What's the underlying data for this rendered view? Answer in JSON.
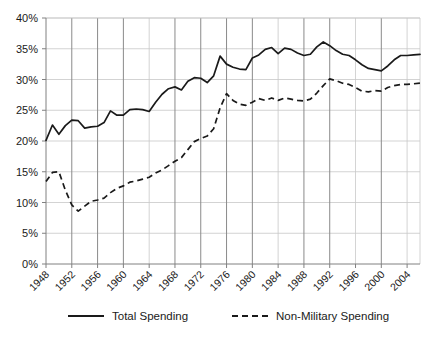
{
  "chart_data": {
    "type": "line",
    "title": "",
    "subtitle": "",
    "xlabel": "",
    "ylabel": "",
    "xlim": [
      1948,
      2006
    ],
    "ylim": [
      0,
      40
    ],
    "yticks": [
      "0%",
      "5%",
      "10%",
      "15%",
      "20%",
      "25%",
      "30%",
      "35%",
      "40%"
    ],
    "ytick_values": [
      0,
      5,
      10,
      15,
      20,
      25,
      30,
      35,
      40
    ],
    "xticks": [
      "1948",
      "1952",
      "1956",
      "1960",
      "1964",
      "1968",
      "1972",
      "1976",
      "1980",
      "1984",
      "1988",
      "1992",
      "1996",
      "2000",
      "2004"
    ],
    "xtick_values": [
      1948,
      1952,
      1956,
      1960,
      1964,
      1968,
      1972,
      1976,
      1980,
      1984,
      1988,
      1992,
      1996,
      2000,
      2004
    ],
    "grid": "horizontal-minor-and-vertical",
    "major_gridline_years": [
      1952,
      1956,
      1960,
      1968,
      1972,
      1976,
      1980,
      1988,
      1992,
      2000
    ],
    "legend_position": "bottom",
    "x": [
      1948,
      1949,
      1950,
      1951,
      1952,
      1953,
      1954,
      1955,
      1956,
      1957,
      1958,
      1959,
      1960,
      1961,
      1962,
      1963,
      1964,
      1965,
      1966,
      1967,
      1968,
      1969,
      1970,
      1971,
      1972,
      1973,
      1974,
      1975,
      1976,
      1977,
      1978,
      1979,
      1980,
      1981,
      1982,
      1983,
      1984,
      1985,
      1986,
      1987,
      1988,
      1989,
      1990,
      1991,
      1992,
      1993,
      1994,
      1995,
      1996,
      1997,
      1998,
      1999,
      2000,
      2001,
      2002,
      2003,
      2004,
      2005,
      2006
    ],
    "series": [
      {
        "name": "Total Spending",
        "style": "solid",
        "color": "#1a1a1a",
        "values": [
          20.1,
          22.6,
          21.1,
          22.5,
          23.4,
          23.3,
          22.1,
          22.3,
          22.4,
          23.0,
          24.9,
          24.2,
          24.2,
          25.1,
          25.2,
          25.1,
          24.8,
          26.3,
          27.6,
          28.5,
          28.8,
          28.3,
          29.7,
          30.3,
          30.2,
          29.5,
          30.6,
          33.8,
          32.5,
          32.0,
          31.7,
          31.6,
          33.5,
          34.0,
          34.9,
          35.2,
          34.2,
          35.1,
          34.9,
          34.3,
          33.9,
          34.1,
          35.3,
          36.1,
          35.5,
          34.7,
          34.1,
          33.9,
          33.2,
          32.4,
          31.8,
          31.6,
          31.4,
          32.2,
          33.2,
          33.9,
          33.9,
          34.0,
          34.1
        ]
      },
      {
        "name": "Non-Military Spending",
        "style": "dashed",
        "color": "#1a1a1a",
        "values": [
          13.4,
          14.9,
          15.0,
          12.0,
          9.6,
          8.6,
          9.4,
          10.2,
          10.4,
          10.7,
          11.6,
          12.3,
          12.7,
          13.3,
          13.5,
          13.8,
          14.1,
          14.8,
          15.3,
          16.0,
          16.7,
          17.3,
          18.6,
          19.9,
          20.4,
          20.8,
          22.0,
          25.4,
          27.7,
          26.6,
          26.0,
          25.8,
          26.3,
          26.9,
          26.6,
          27.0,
          26.6,
          27.0,
          26.8,
          26.6,
          26.5,
          26.8,
          27.8,
          29.0,
          30.1,
          29.8,
          29.4,
          29.2,
          28.7,
          28.1,
          28.0,
          28.2,
          28.1,
          28.7,
          29.0,
          29.2,
          29.2,
          29.3,
          29.4
        ]
      }
    ]
  },
  "legend": {
    "items": [
      {
        "label": "Total Spending",
        "style": "solid"
      },
      {
        "label": "Non-Military Spending",
        "style": "dashed"
      }
    ]
  }
}
